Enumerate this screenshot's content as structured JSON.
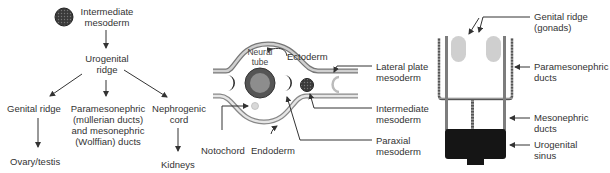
{
  "flowchart": {
    "root": {
      "line1": "Intermediate",
      "line2": "mesoderm"
    },
    "mid": {
      "line1": "Urogenital",
      "line2": "ridge"
    },
    "branches": [
      {
        "label": "Genital ridge",
        "outcome": "Ovary/testis"
      },
      {
        "line1": "Paramesonephric",
        "line2": "(müllerian ducts)",
        "line3": "and mesonephric",
        "line4": "(Wolffian) ducts"
      },
      {
        "line1": "Nephrogenic",
        "line2": "cord",
        "outcome": "Kidneys"
      }
    ]
  },
  "cross_section": {
    "neural_tube": {
      "line1": "Neural",
      "line2": "tube"
    },
    "ectoderm": "Ectoderm",
    "endoderm": "Endoderm",
    "notochord": "Notochord",
    "lateral_plate": {
      "line1": "Lateral plate",
      "line2": "mesoderm"
    },
    "intermediate": {
      "line1": "Intermediate",
      "line2": "mesoderm"
    },
    "paraxial": {
      "line1": "Paraxial",
      "line2": "mesoderm"
    }
  },
  "duct_diagram": {
    "genital_ridge": {
      "line1": "Genital ridge",
      "line2": "(gonads)"
    },
    "paramesonephric": {
      "line1": "Paramesonephric",
      "line2": "ducts"
    },
    "mesonephric": {
      "line1": "Mesonephric",
      "line2": "ducts"
    },
    "urogenital_sinus": {
      "line1": "Urogenital",
      "line2": "sinus"
    }
  },
  "colors": {
    "dark": "#2a2a2a",
    "mid_gray": "#8a8a8a",
    "light_gray": "#c8c8c8",
    "line": "#333333"
  }
}
